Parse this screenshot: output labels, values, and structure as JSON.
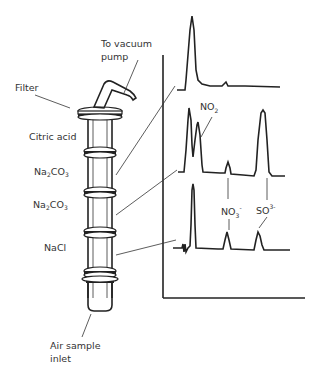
{
  "diagram": {
    "type": "air-sampling-denuder-with-chromatograms",
    "labels": {
      "vacuum": [
        "To vacuum",
        "pump"
      ],
      "filter": "Filter",
      "citric": "Citric acid",
      "na2co3_1": {
        "main": "Na",
        "sub1": "2",
        "mid": "CO",
        "sub2": "3"
      },
      "na2co3_2": {
        "main": "Na",
        "sub1": "2",
        "mid": "CO",
        "sub2": "3"
      },
      "nacl": "NaCl",
      "inlet": [
        "Air sample",
        "inlet"
      ],
      "no2": {
        "main": "NO",
        "sub": "2"
      },
      "no3": {
        "main": "NO",
        "sub": "3",
        "sup": "-"
      },
      "so3": {
        "main": "SO",
        "sup": "3-"
      }
    },
    "sections": [
      "Filter",
      "Citric acid",
      "Na2CO3",
      "Na2CO3",
      "NaCl"
    ],
    "chromatograms": [
      {
        "name": "top-trace",
        "peaks": [
          "large early peak",
          "small bump"
        ]
      },
      {
        "name": "middle-trace",
        "peaks": [
          "doublet incl. NO2",
          "NO3- small",
          "SO3 large"
        ]
      },
      {
        "name": "bottom-trace",
        "peaks": [
          "early peak",
          "NO3-",
          "SO3-"
        ]
      }
    ]
  }
}
